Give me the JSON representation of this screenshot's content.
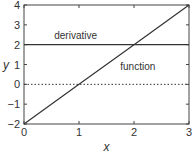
{
  "chart_data": {
    "type": "line",
    "title": "",
    "xlabel": "x",
    "ylabel": "y",
    "xlim": [
      0,
      3
    ],
    "ylim": [
      -2,
      4
    ],
    "x_ticks": [
      "0",
      "1",
      "2",
      "3"
    ],
    "y_ticks": [
      "−2",
      "−1",
      "0",
      "1",
      "2",
      "3",
      "4"
    ],
    "grid": false,
    "series": [
      {
        "name": "function",
        "x": [
          0,
          1,
          2,
          3
        ],
        "y": [
          -2,
          0,
          2,
          4
        ],
        "style": "solid"
      },
      {
        "name": "derivative",
        "x": [
          0,
          3
        ],
        "y": [
          2,
          2
        ],
        "style": "solid"
      },
      {
        "name": "zero line",
        "x": [
          0,
          3
        ],
        "y": [
          0,
          0
        ],
        "style": "dotted"
      }
    ],
    "annotations": [
      {
        "text": "derivative",
        "x": 0.55,
        "y": 2.3
      },
      {
        "text": "function",
        "x": 1.75,
        "y": 0.7
      }
    ]
  }
}
